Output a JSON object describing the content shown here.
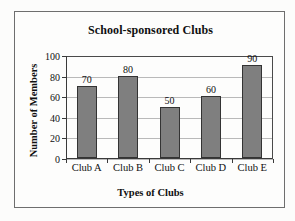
{
  "chart_data": {
    "type": "bar",
    "title": "School-sponsored Clubs",
    "xlabel": "Types of Clubs",
    "ylabel": "Number of Members",
    "categories": [
      "Club A",
      "Club B",
      "Club C",
      "Club D",
      "Club E"
    ],
    "values": [
      70,
      80,
      50,
      60,
      90
    ],
    "value_labels": [
      "70",
      "80",
      "50",
      "60",
      "90"
    ],
    "ylim": [
      0,
      100
    ],
    "yticks": [
      0,
      20,
      40,
      60,
      80,
      100
    ],
    "ytick_labels": [
      "0",
      "20",
      "40",
      "60",
      "80",
      "100"
    ],
    "grid": "horizontal",
    "legend": "none",
    "bar_color": "#7f7f7f",
    "bar_border_color": "#333333",
    "axis_color": "#3a3a3a",
    "gridline_color": "#b9b9b9",
    "plot_background": "#fdfdfc",
    "frame_border_color": "#6e6e6e"
  }
}
